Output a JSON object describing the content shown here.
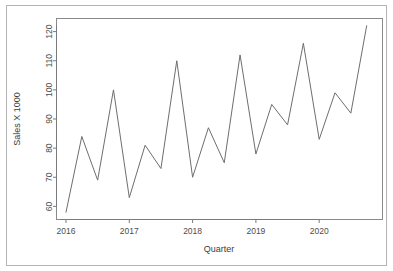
{
  "chart_data": {
    "type": "line",
    "title": "",
    "subtitle": "",
    "xlabel": "Quarter",
    "ylabel": "Sales X 1000",
    "x": [
      2016.0,
      2016.25,
      2016.5,
      2016.75,
      2017.0,
      2017.25,
      2017.5,
      2017.75,
      2018.0,
      2018.25,
      2018.5,
      2018.75,
      2019.0,
      2019.25,
      2019.5,
      2019.75,
      2020.0,
      2020.25,
      2020.5,
      2020.75
    ],
    "categories": [
      "2016 Q1",
      "2016 Q2",
      "2016 Q3",
      "2016 Q4",
      "2017 Q1",
      "2017 Q2",
      "2017 Q3",
      "2017 Q4",
      "2018 Q1",
      "2018 Q2",
      "2018 Q3",
      "2018 Q4",
      "2019 Q1",
      "2019 Q2",
      "2019 Q3",
      "2019 Q4",
      "2020 Q1",
      "2020 Q2",
      "2020 Q3",
      "2020 Q4"
    ],
    "values": [
      58,
      84,
      69,
      100,
      63,
      81,
      73,
      110,
      70,
      87,
      75,
      112,
      78,
      95,
      88,
      116,
      83,
      99,
      92,
      122
    ],
    "series": [
      {
        "name": "Sales",
        "values": [
          58,
          84,
          69,
          100,
          63,
          81,
          73,
          110,
          70,
          87,
          75,
          112,
          78,
          95,
          88,
          116,
          83,
          99,
          92,
          122
        ],
        "color": "#6e6e6e"
      }
    ],
    "xlim": [
      2015.85,
      2021.0
    ],
    "ylim": [
      55.5,
      124.5
    ],
    "xticks": [
      2016,
      2017,
      2018,
      2019,
      2020
    ],
    "xtick_labels": [
      "2016",
      "2017",
      "2018",
      "2019",
      "2020"
    ],
    "yticks": [
      60,
      70,
      80,
      90,
      100,
      110,
      120
    ],
    "ytick_labels": [
      "60",
      "70",
      "80",
      "90",
      "100",
      "110",
      "120"
    ],
    "grid": false,
    "legend": null,
    "legend_position": "none",
    "annotations": []
  },
  "style": {
    "line_color": "#6e6e6e",
    "axis_color": "#7a7a7a",
    "frame_color": "#b4b4b4",
    "text_color": "#4d4d4d",
    "background": "#ffffff"
  }
}
